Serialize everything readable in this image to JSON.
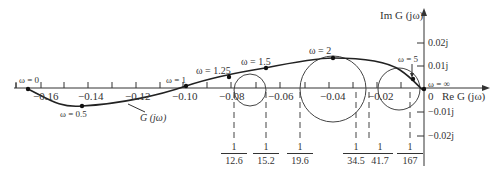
{
  "diagram": {
    "type": "polar-plot",
    "curve_label": "G (jω)",
    "axes": {
      "real_label": "Re G (jω)",
      "imag_label": "Im G (jω)",
      "origin_label": "0",
      "real_ticks": [
        "−0.16",
        "−0.14",
        "−0.12",
        "−0.10",
        "−0.08",
        "−0.06",
        "−0.04",
        "−0.02"
      ],
      "imag_ticks": [
        "0.02j",
        "0.01j",
        "−0.01j",
        "−0.02j"
      ]
    },
    "frequency_points": [
      {
        "label": "ω = 0"
      },
      {
        "label": "ω = 0.5"
      },
      {
        "label": "ω = 1"
      },
      {
        "label": "ω = 1.25"
      },
      {
        "label": "ω = 1.5"
      },
      {
        "label": "ω = 2"
      },
      {
        "label": "ω = 5"
      },
      {
        "label": "ω = ∞"
      }
    ],
    "circle_intercepts": [
      {
        "num": "1",
        "den": "12.6"
      },
      {
        "num": "1",
        "den": "15.2"
      },
      {
        "num": "1",
        "den": "19.6"
      },
      {
        "num": "1",
        "den": "34.5"
      },
      {
        "num": "1",
        "den": "41.7"
      },
      {
        "num": "1",
        "den": "167"
      }
    ]
  }
}
